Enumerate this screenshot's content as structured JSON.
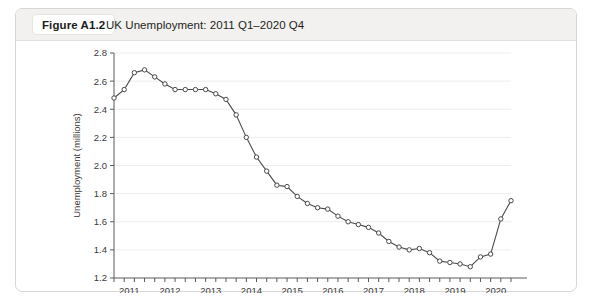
{
  "card": {
    "figure_number": "Figure A1.2",
    "title": "UK Unemployment: 2011 Q1–2020 Q4"
  },
  "chart_data": {
    "type": "line",
    "title": "UK Unemployment: 2011 Q1–2020 Q4",
    "xlabel": "",
    "ylabel": "Unemployment (millions)",
    "ylim": [
      1.2,
      2.8
    ],
    "ytick_step": 0.2,
    "yticks": [
      "1.2",
      "1.4",
      "1.6",
      "1.8",
      "2.0",
      "2.2",
      "2.4",
      "2.6",
      "2.8"
    ],
    "xlim": [
      "2011 Q1",
      "2020 Q4"
    ],
    "xticks": [
      "2011",
      "2012",
      "2013",
      "2014",
      "2015",
      "2016",
      "2017",
      "2018",
      "2019",
      "2020"
    ],
    "minor_tick_interval": "quarterly",
    "grid": "horizontal",
    "legend": "none",
    "marker": "open-circle",
    "line_color": "#4a4a4a",
    "grid_color": "#ededed",
    "x": [
      "2011 Q1",
      "2011 Q2",
      "2011 Q3",
      "2011 Q4",
      "2012 Q1",
      "2012 Q2",
      "2012 Q3",
      "2012 Q4",
      "2013 Q1",
      "2013 Q2",
      "2013 Q3",
      "2013 Q4",
      "2014 Q1",
      "2014 Q2",
      "2014 Q3",
      "2014 Q4",
      "2015 Q1",
      "2015 Q2",
      "2015 Q3",
      "2015 Q4",
      "2016 Q1",
      "2016 Q2",
      "2016 Q3",
      "2016 Q4",
      "2017 Q1",
      "2017 Q2",
      "2017 Q3",
      "2017 Q4",
      "2018 Q1",
      "2018 Q2",
      "2018 Q3",
      "2018 Q4",
      "2019 Q1",
      "2019 Q2",
      "2019 Q3",
      "2019 Q4",
      "2020 Q1",
      "2020 Q2",
      "2020 Q3",
      "2020 Q4"
    ],
    "values": [
      2.48,
      2.54,
      2.66,
      2.68,
      2.63,
      2.58,
      2.54,
      2.54,
      2.54,
      2.54,
      2.51,
      2.47,
      2.36,
      2.2,
      2.06,
      1.96,
      1.86,
      1.85,
      1.78,
      1.73,
      1.7,
      1.69,
      1.64,
      1.6,
      1.58,
      1.56,
      1.52,
      1.46,
      1.42,
      1.4,
      1.41,
      1.38,
      1.32,
      1.31,
      1.3,
      1.28,
      1.35,
      1.37,
      1.62,
      1.75
    ]
  }
}
